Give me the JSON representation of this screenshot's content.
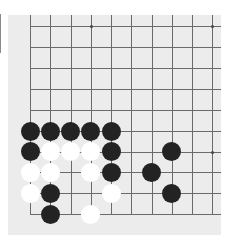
{
  "board": {
    "colors": {
      "background": "#ececec",
      "line": "#6a6a6a",
      "black_stone": "#232323",
      "white_stone": "#ffffff",
      "star_point": "#444444"
    },
    "columns": 10,
    "rows": 10,
    "column_x": [
      30,
      50.3,
      70.5,
      90.8,
      111,
      131.3,
      151.5,
      171.7,
      191.8,
      212
    ],
    "row_y": [
      26,
      46.8,
      67.7,
      88.7,
      110,
      131,
      151.7,
      172.3,
      193.3,
      214.3
    ],
    "visible_edges": [
      "left",
      "bottom"
    ],
    "star_points": [
      {
        "col": 3,
        "row": 0
      },
      {
        "col": 9,
        "row": 0
      },
      {
        "col": 9,
        "row": 6
      }
    ],
    "stones": [
      {
        "color": "black",
        "col": 0,
        "row": 5
      },
      {
        "color": "black",
        "col": 1,
        "row": 5
      },
      {
        "color": "black",
        "col": 2,
        "row": 5
      },
      {
        "color": "black",
        "col": 3,
        "row": 5
      },
      {
        "color": "black",
        "col": 4,
        "row": 5
      },
      {
        "color": "black",
        "col": 0,
        "row": 6
      },
      {
        "color": "white",
        "col": 1,
        "row": 6
      },
      {
        "color": "white",
        "col": 2,
        "row": 6
      },
      {
        "color": "white",
        "col": 3,
        "row": 6
      },
      {
        "color": "black",
        "col": 4,
        "row": 6
      },
      {
        "color": "black",
        "col": 7,
        "row": 6
      },
      {
        "color": "white",
        "col": 0,
        "row": 7
      },
      {
        "color": "white",
        "col": 1,
        "row": 7
      },
      {
        "color": "white",
        "col": 3,
        "row": 7
      },
      {
        "color": "black",
        "col": 4,
        "row": 7
      },
      {
        "color": "black",
        "col": 6,
        "row": 7
      },
      {
        "color": "white",
        "col": 0,
        "row": 8
      },
      {
        "color": "black",
        "col": 1,
        "row": 8
      },
      {
        "color": "white",
        "col": 4,
        "row": 8
      },
      {
        "color": "black",
        "col": 7,
        "row": 8
      },
      {
        "color": "black",
        "col": 1,
        "row": 9
      },
      {
        "color": "white",
        "col": 3,
        "row": 9
      }
    ]
  }
}
